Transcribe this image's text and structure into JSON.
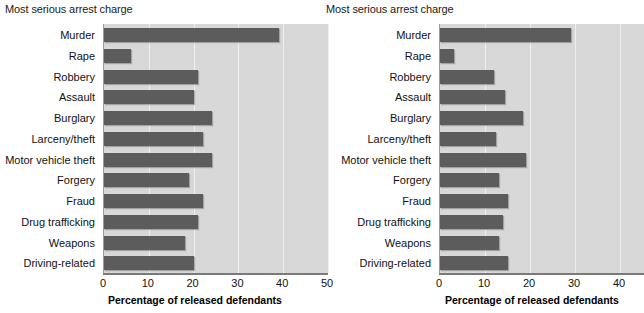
{
  "panels": [
    {
      "title": "Most serious arrest charge",
      "xaxis_title": "Percentage of released defendants",
      "xticks": [
        "0",
        "10",
        "20",
        "30",
        "40",
        "50"
      ]
    },
    {
      "title": "Most serious arrest charge",
      "xaxis_title": "Percentage of released defendants",
      "xticks": [
        "0",
        "10",
        "20",
        "30",
        "40"
      ]
    }
  ],
  "categories": [
    "Murder",
    "Rape",
    "Robbery",
    "Assault",
    "Burglary",
    "Larceny/theft",
    "Motor vehicle theft",
    "Forgery",
    "Fraud",
    "Drug trafficking",
    "Weapons",
    "Driving-related"
  ],
  "chart_data": [
    {
      "type": "bar",
      "orientation": "horizontal",
      "title": "Most serious arrest charge",
      "xlabel": "Percentage of released defendants",
      "ylabel": "Most serious arrest charge",
      "xlim": [
        0,
        50
      ],
      "xticks": [
        0,
        10,
        20,
        30,
        40,
        50
      ],
      "grid": "vertical",
      "legend": "none",
      "bar_color": "#5c5c5c",
      "plot_background": "#d8d8d8",
      "categories": [
        "Murder",
        "Rape",
        "Robbery",
        "Assault",
        "Burglary",
        "Larceny/theft",
        "Motor vehicle theft",
        "Forgery",
        "Fraud",
        "Drug trafficking",
        "Weapons",
        "Driving-related"
      ],
      "values": [
        39,
        6,
        21,
        20,
        24,
        22,
        24,
        19,
        22,
        21,
        18,
        20
      ]
    },
    {
      "type": "bar",
      "orientation": "horizontal",
      "title": "Most serious arrest charge",
      "xlabel": "Percentage of released defendants",
      "ylabel": "Most serious arrest charge",
      "xlim": [
        0,
        45.3
      ],
      "xticks": [
        0,
        10,
        20,
        30,
        40
      ],
      "grid": "vertical",
      "legend": "none",
      "bar_color": "#5c5c5c",
      "plot_background": "#d8d8d8",
      "categories": [
        "Murder",
        "Rape",
        "Robbery",
        "Assault",
        "Burglary",
        "Larceny/theft",
        "Motor vehicle theft",
        "Forgery",
        "Fraud",
        "Drug trafficking",
        "Weapons",
        "Driving-related"
      ],
      "values": [
        29,
        3,
        12,
        14.5,
        18.5,
        12.5,
        19,
        13,
        15,
        14,
        13,
        15
      ]
    }
  ]
}
